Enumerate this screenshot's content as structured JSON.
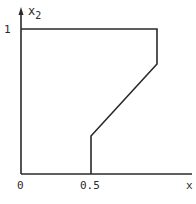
{
  "diagram": {
    "type": "region-plot",
    "axes": {
      "x_label": "x",
      "y_label": "x",
      "y_label_subscript": "2",
      "origin_label": "0",
      "x_tick_label": "0.5",
      "y_tick_label": "1"
    },
    "region_vertices": [
      {
        "x": 0,
        "y": 1
      },
      {
        "x": 1,
        "y": 1
      },
      {
        "x": 1,
        "y": 0.75
      },
      {
        "x": 0.5,
        "y": 0.25
      },
      {
        "x": 0.5,
        "y": 0
      }
    ],
    "colors": {
      "line": "#2a2a2a",
      "background": "#ffffff"
    }
  }
}
